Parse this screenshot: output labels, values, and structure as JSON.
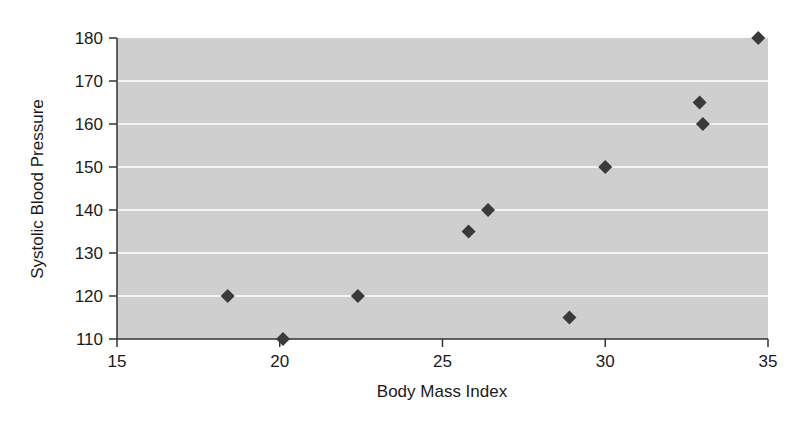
{
  "chart_data": {
    "type": "scatter",
    "title": "",
    "xlabel": "Body Mass Index",
    "ylabel": "Systolic Blood Pressure",
    "xlim": [
      15,
      35
    ],
    "ylim": [
      110,
      180
    ],
    "x_ticks": [
      15,
      20,
      25,
      30,
      35
    ],
    "y_ticks": [
      110,
      120,
      130,
      140,
      150,
      160,
      170,
      180
    ],
    "grid": {
      "horizontal": true,
      "vertical": false,
      "color": "#ffffff"
    },
    "legend": null,
    "marker": "diamond",
    "colors": {
      "plot_background": "#cfcfcf",
      "marker": "#3a3a3a",
      "axis": "#333333"
    },
    "series": [
      {
        "name": "Patients",
        "points": [
          {
            "x": 18.4,
            "y": 120
          },
          {
            "x": 20.1,
            "y": 110
          },
          {
            "x": 22.4,
            "y": 120
          },
          {
            "x": 25.8,
            "y": 135
          },
          {
            "x": 26.4,
            "y": 140
          },
          {
            "x": 28.9,
            "y": 115
          },
          {
            "x": 30.0,
            "y": 150
          },
          {
            "x": 32.9,
            "y": 165
          },
          {
            "x": 33.0,
            "y": 160
          },
          {
            "x": 34.7,
            "y": 180
          }
        ]
      }
    ]
  },
  "labels": {
    "xlabel": "Body Mass Index",
    "ylabel": "Systolic Blood Pressure"
  }
}
